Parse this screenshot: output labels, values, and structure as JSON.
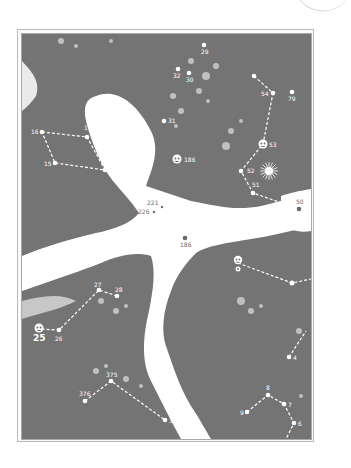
{
  "map": {
    "colors": {
      "canopy": "#747474",
      "clearing": "#ffffff",
      "frame": "#b9b9b9",
      "marker": "#ffffff",
      "path": "#ffffff"
    },
    "waypoints": [
      {
        "id": "29",
        "label": "29",
        "x": 203,
        "y": 44
      },
      {
        "id": "32",
        "label": "32",
        "x": 177,
        "y": 68
      },
      {
        "id": "30",
        "label": "30",
        "x": 188,
        "y": 72
      },
      {
        "id": "54a",
        "label": "",
        "x": 253,
        "y": 75
      },
      {
        "id": "54",
        "label": "54",
        "x": 272,
        "y": 92
      },
      {
        "id": "79",
        "label": "79",
        "x": 291,
        "y": 91
      },
      {
        "id": "31",
        "label": "31",
        "x": 163,
        "y": 120
      },
      {
        "id": "16",
        "label": "16",
        "x": 41,
        "y": 131
      },
      {
        "id": "17",
        "label": "17",
        "x": 86,
        "y": 136
      },
      {
        "id": "15",
        "label": "15",
        "x": 54,
        "y": 162
      },
      {
        "id": "14",
        "label": "",
        "x": 104,
        "y": 169
      },
      {
        "id": "53",
        "label": "53",
        "x": 262,
        "y": 143
      },
      {
        "id": "186",
        "label": "186",
        "x": 176,
        "y": 158
      },
      {
        "id": "52",
        "label": "52",
        "x": 240,
        "y": 170
      },
      {
        "id": "51",
        "label": "51",
        "x": 252,
        "y": 192
      },
      {
        "id": "50",
        "label": "50",
        "x": 298,
        "y": 208
      },
      {
        "id": "221",
        "label": "221",
        "x": 161,
        "y": 206
      },
      {
        "id": "226",
        "label": "226",
        "x": 153,
        "y": 211
      },
      {
        "id": "186b",
        "label": "186",
        "x": 184,
        "y": 237
      },
      {
        "id": "869",
        "label": "869",
        "x": 50,
        "y": 247
      },
      {
        "id": "27",
        "label": "27",
        "x": 98,
        "y": 289
      },
      {
        "id": "28",
        "label": "28",
        "x": 116,
        "y": 295
      },
      {
        "id": "0",
        "label": "",
        "x": 237,
        "y": 262
      },
      {
        "id": "1",
        "label": "",
        "x": 291,
        "y": 282
      },
      {
        "id": "25",
        "label": "25",
        "x": 38,
        "y": 328
      },
      {
        "id": "26",
        "label": "26",
        "x": 58,
        "y": 329
      },
      {
        "id": "4",
        "label": "4",
        "x": 288,
        "y": 356
      },
      {
        "id": "375",
        "label": "375",
        "x": 110,
        "y": 380
      },
      {
        "id": "376",
        "label": "376",
        "x": 84,
        "y": 400
      },
      {
        "id": "377",
        "label": "377",
        "x": 164,
        "y": 419
      },
      {
        "id": "8",
        "label": "8",
        "x": 267,
        "y": 394
      },
      {
        "id": "7",
        "label": "7",
        "x": 283,
        "y": 403
      },
      {
        "id": "9",
        "label": "9",
        "x": 246,
        "y": 411
      },
      {
        "id": "6",
        "label": "6",
        "x": 293,
        "y": 422
      }
    ],
    "special_markers": [
      {
        "type": "skull-icon",
        "label": "186",
        "x": 176,
        "y": 158
      },
      {
        "type": "skull-icon",
        "label": "53",
        "x": 262,
        "y": 143
      },
      {
        "type": "skull-icon",
        "label": "25",
        "x": 38,
        "y": 328
      },
      {
        "type": "skull-icon",
        "label": "",
        "x": 237,
        "y": 262
      },
      {
        "type": "sun-burst-icon",
        "label": "",
        "x": 268,
        "y": 170
      }
    ],
    "labels": {
      "l29": "29",
      "l32": "32",
      "l30": "30",
      "l54": "54",
      "l79": "79",
      "l31": "31",
      "l16": "16",
      "l17": "17",
      "l15": "15",
      "l53": "53",
      "l186": "186",
      "l52": "52",
      "l51": "51",
      "l50": "50",
      "l221": "221",
      "l226": "226",
      "l186b": "186",
      "l869": "869",
      "l27": "27",
      "l28": "28",
      "l25": "25",
      "l26": "26",
      "l4": "4",
      "l375": "375",
      "l376": "376",
      "l377": "377",
      "l8": "8",
      "l7": "7",
      "l9": "9",
      "l6": "6"
    }
  }
}
